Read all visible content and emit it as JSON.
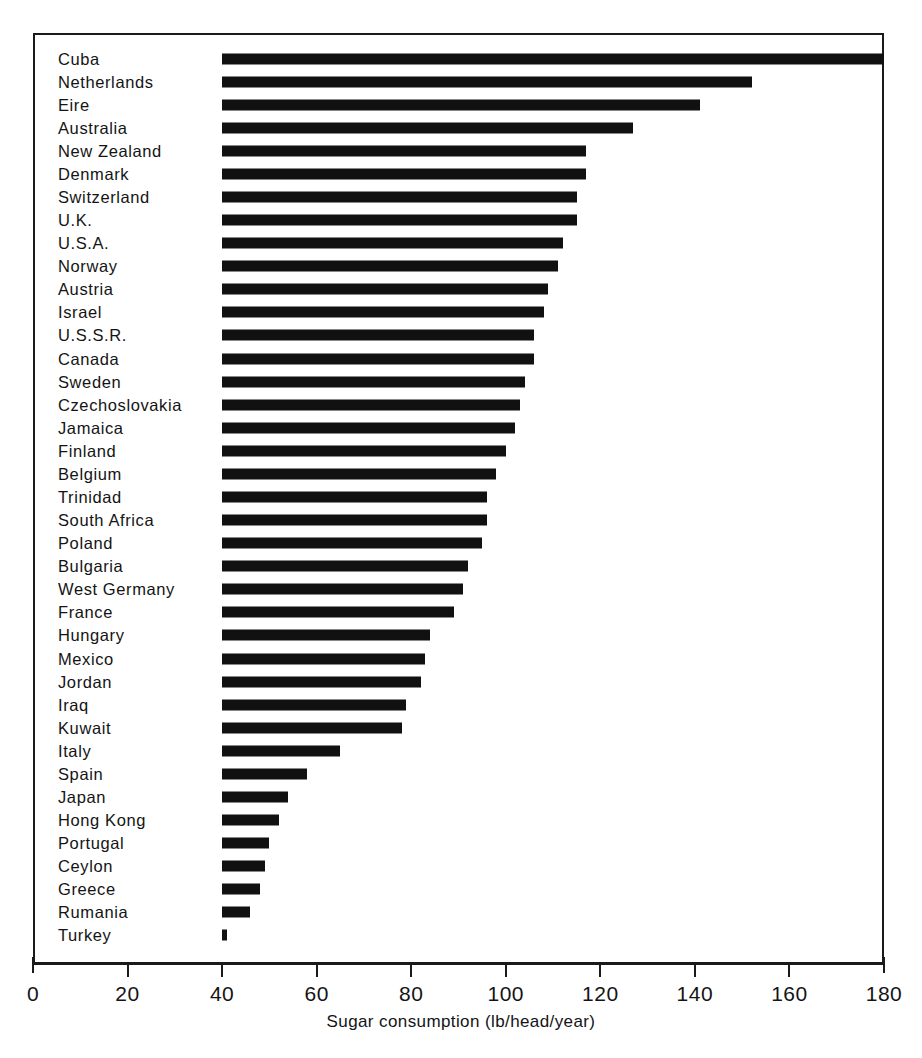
{
  "chart_data": {
    "type": "bar",
    "orientation": "horizontal",
    "title": "",
    "xlabel": "Sugar consumption (lb/head/year)",
    "ylabel": "",
    "xlim": [
      0,
      180
    ],
    "ylim": null,
    "grid": false,
    "legend": null,
    "bar_baseline": 40,
    "xticks": [
      0,
      20,
      40,
      60,
      80,
      100,
      120,
      140,
      160,
      180
    ],
    "xtick_labels": [
      "0",
      "20",
      "40",
      "60",
      "80",
      "100",
      "120",
      "140",
      "160",
      "180"
    ],
    "categories": [
      "Cuba",
      "Netherlands",
      "Eire",
      "Australia",
      "New Zealand",
      "Denmark",
      "Switzerland",
      "U.K.",
      "U.S.A.",
      "Norway",
      "Austria",
      "Israel",
      "U.S.S.R.",
      "Canada",
      "Sweden",
      "Czechoslovakia",
      "Jamaica",
      "Finland",
      "Belgium",
      "Trinidad",
      "South Africa",
      "Poland",
      "Bulgaria",
      "West Germany",
      "France",
      "Hungary",
      "Mexico",
      "Jordan",
      "Iraq",
      "Kuwait",
      "Italy",
      "Spain",
      "Japan",
      "Hong Kong",
      "Portugal",
      "Ceylon",
      "Greece",
      "Rumania",
      "Turkey"
    ],
    "values": [
      180,
      152,
      141,
      127,
      117,
      117,
      115,
      115,
      112,
      111,
      109,
      108,
      106,
      106,
      104,
      103,
      102,
      100,
      98,
      96,
      96,
      95,
      92,
      91,
      89,
      84,
      83,
      82,
      79,
      78,
      65,
      58,
      54,
      52,
      50,
      49,
      48,
      46,
      41
    ]
  },
  "axis": {
    "x_title": "Sugar consumption (lb/head/year)"
  }
}
